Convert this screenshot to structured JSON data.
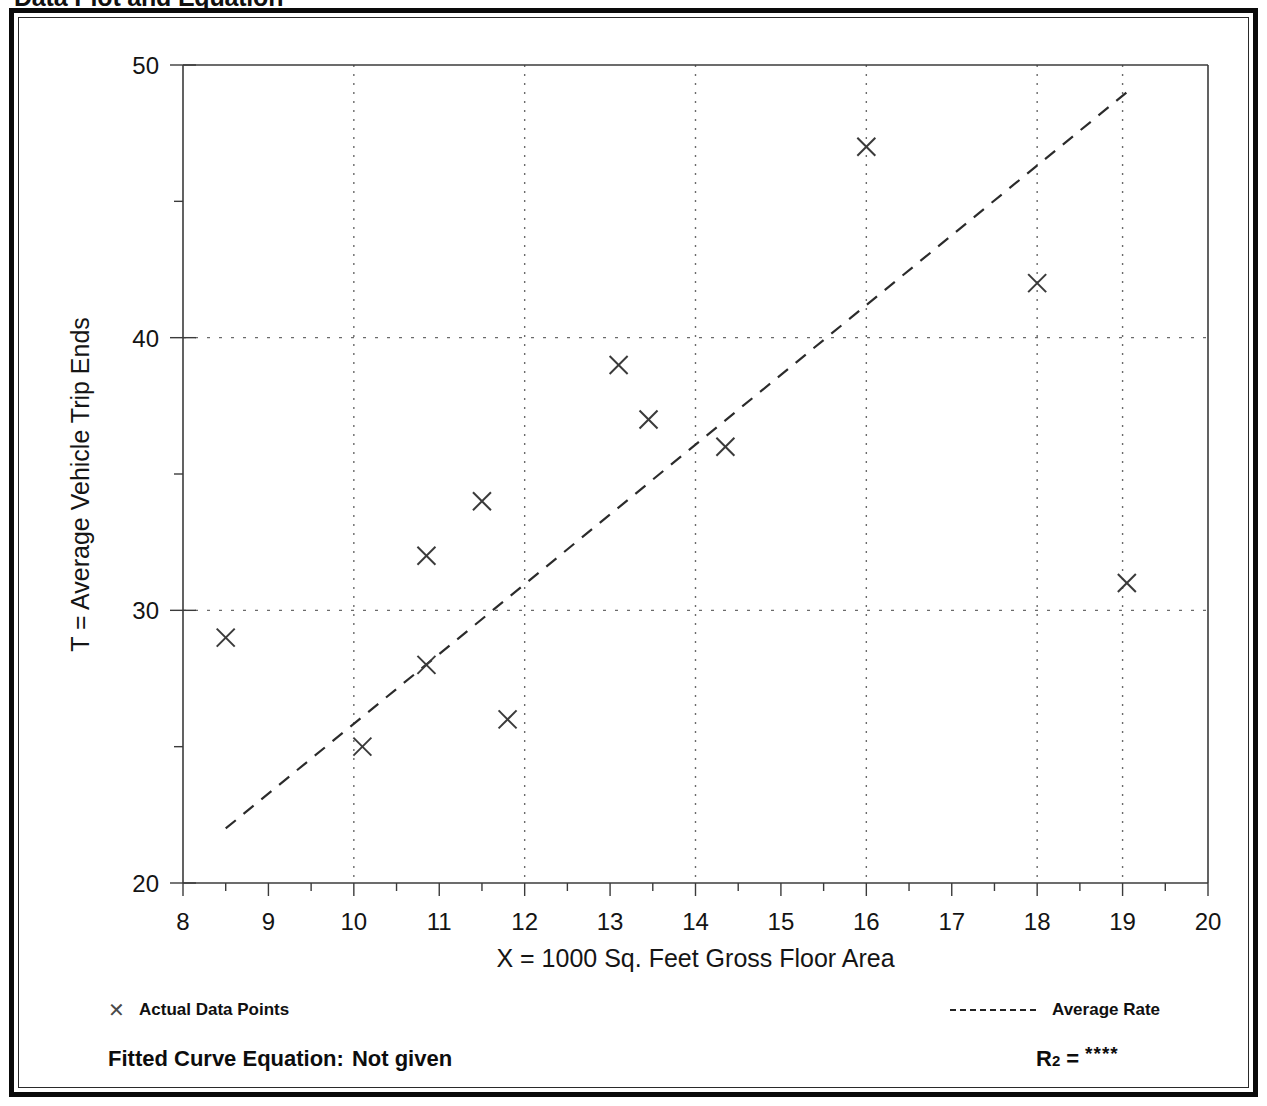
{
  "page": {
    "title": "Data Plot and Equation"
  },
  "legend": {
    "points_label": "Actual Data Points",
    "points_marker": "cross-marker-icon",
    "rate_label": "Average Rate",
    "rate_marker": "dashed-line-icon"
  },
  "equation": {
    "label": "Fitted Curve Equation:",
    "value": "Not given",
    "r2_symbol": "R",
    "r2_exponent": "2",
    "r2_equals": "=",
    "r2_value": "****"
  },
  "chart_data": {
    "type": "scatter",
    "title": "Data Plot and Equation",
    "xlabel": "X = 1000 Sq. Feet Gross Floor Area",
    "ylabel": "T = Average Vehicle Trip Ends",
    "xlim": [
      8,
      20
    ],
    "ylim": [
      20,
      50
    ],
    "x_major_ticks": [
      8,
      9,
      10,
      11,
      12,
      13,
      14,
      15,
      16,
      17,
      18,
      19,
      20
    ],
    "x_tick_labels": [
      "8",
      "9",
      "10",
      "11",
      "12",
      "13",
      "14",
      "15",
      "16",
      "17",
      "18",
      "19",
      "20"
    ],
    "x_minor_tick_step": 0.5,
    "y_major_ticks": [
      20,
      30,
      40,
      50
    ],
    "y_tick_labels": [
      "20",
      "30",
      "40",
      "50"
    ],
    "y_minor_ticks": [
      25,
      35,
      45
    ],
    "grid": {
      "vertical_dotted_at": [
        10,
        12,
        14,
        16,
        18,
        19
      ],
      "horizontal_dotted_at": [
        30,
        40
      ],
      "style": "dotted"
    },
    "series": [
      {
        "name": "Actual Data Points",
        "type": "scatter",
        "marker": "x",
        "color": "#3a3a3a",
        "points": [
          {
            "x": 8.5,
            "y": 29
          },
          {
            "x": 10.1,
            "y": 25
          },
          {
            "x": 10.85,
            "y": 28
          },
          {
            "x": 10.85,
            "y": 32
          },
          {
            "x": 11.5,
            "y": 34
          },
          {
            "x": 11.8,
            "y": 26
          },
          {
            "x": 13.1,
            "y": 39
          },
          {
            "x": 13.45,
            "y": 37
          },
          {
            "x": 14.35,
            "y": 36
          },
          {
            "x": 16.0,
            "y": 47
          },
          {
            "x": 18.0,
            "y": 42
          },
          {
            "x": 19.05,
            "y": 31
          }
        ]
      },
      {
        "name": "Average Rate",
        "type": "line",
        "style": "dashed",
        "color": "#2b2b2b",
        "endpoints": [
          {
            "x": 8.5,
            "y": 22.0
          },
          {
            "x": 19.05,
            "y": 49.0
          }
        ]
      }
    ]
  }
}
